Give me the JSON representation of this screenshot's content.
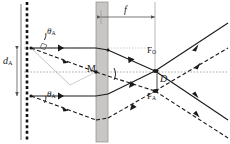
{
  "figure": {
    "type": "optical-ray-diagram",
    "background_color": "#ffffff",
    "ink_color": "#1a1a1a",
    "slab_fill": "#c8c6c4",
    "slab_stroke": "#8c8a88",
    "axis_color": "#b0b0b0"
  },
  "labels": {
    "distance_d": {
      "text": "d",
      "sub": "A",
      "x": 4,
      "y": 58
    },
    "focal_f": {
      "text": "f",
      "sub": "",
      "x": 125,
      "y": 9
    },
    "theta_top": {
      "text": "θ",
      "sub": "A",
      "x": 47,
      "y": 28
    },
    "theta_bottom": {
      "text": "θ",
      "sub": "A",
      "x": 47,
      "y": 91
    },
    "mirror_M": {
      "text": "M",
      "sub": "",
      "x": 89,
      "y": 65
    },
    "focus_O": {
      "text": "F",
      "sub": "O",
      "x": 148,
      "y": 48
    },
    "focus_A": {
      "text": "F",
      "sub": "A",
      "x": 148,
      "y": 90
    },
    "separation_D": {
      "text": "D",
      "sub": "",
      "x": 152,
      "y": 66
    }
  },
  "elements": {
    "source_plane": {
      "name": "dashed-source-line",
      "style": "thick-dashed-vertical",
      "x": 26
    },
    "aperture_bar": {
      "name": "left-solid-bar",
      "style": "thin-solid-vertical",
      "x": 21
    },
    "lens_slab": {
      "name": "gray-vertical-slab",
      "x": 96,
      "width": 12
    },
    "optical_axis": {
      "name": "dotted-horizontal-axis",
      "y": 72
    },
    "focal_dim_line": {
      "name": "focal-length-dimension",
      "y": 17
    },
    "separation_dim_line": {
      "name": "separation-dimension",
      "x": 157
    }
  },
  "rays": {
    "solid_count": 4,
    "dashed_count": 4,
    "description": "Two ray bundles (on-axis solid, off-axis dashed) crossing at foci F_O and F_A"
  }
}
